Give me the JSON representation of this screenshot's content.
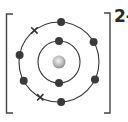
{
  "diagram": {
    "ion_charge": "2-",
    "colors": {
      "line": "#333333",
      "electron": "#3a3a3a",
      "nucleus_light": "#f2f2f2",
      "nucleus_dark": "#8a8a8a",
      "background": "#ffffff"
    },
    "center": [
      59,
      62
    ],
    "shells": [
      {
        "name": "inner-shell",
        "radius": 21,
        "electrons": [
          {
            "type": "dot",
            "angle": -90
          },
          {
            "type": "dot",
            "angle": 90
          }
        ]
      },
      {
        "name": "outer-shell",
        "radius": 40,
        "electrons": [
          {
            "type": "dot",
            "angle": -87
          },
          {
            "type": "cross",
            "angle": -128
          },
          {
            "type": "dot",
            "angle": -170
          },
          {
            "type": "dot",
            "angle": -30
          },
          {
            "type": "dot",
            "angle": 26
          },
          {
            "type": "dot",
            "angle": 87
          },
          {
            "type": "cross",
            "angle": 118
          },
          {
            "type": "dot",
            "angle": 152
          }
        ]
      }
    ]
  }
}
